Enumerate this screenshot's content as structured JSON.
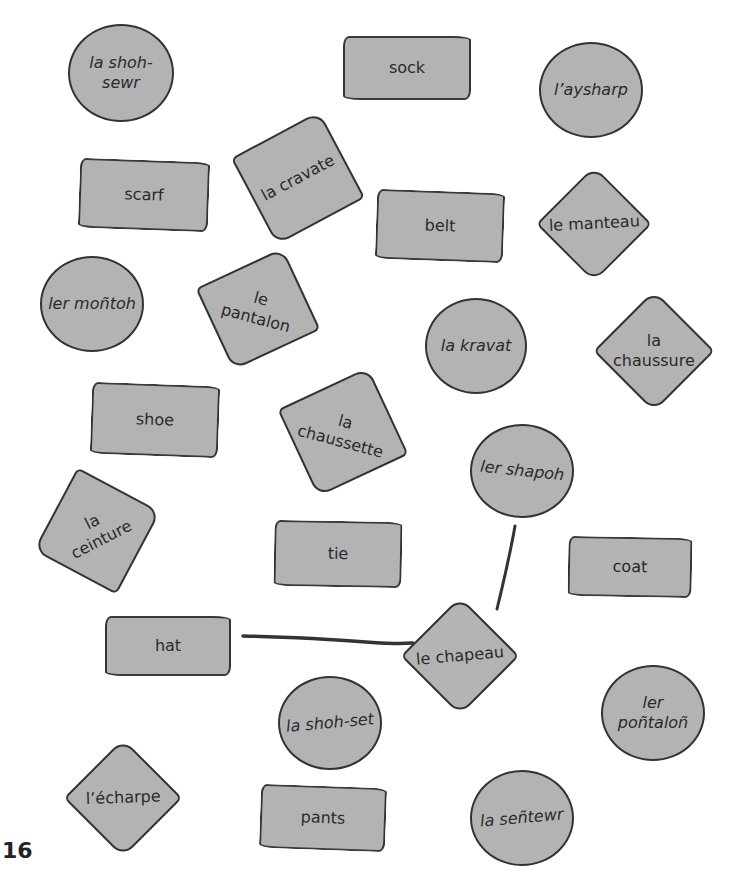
{
  "page_number": "16",
  "colors": {
    "card_fill": "#b3b3b3",
    "card_outline": "#333333",
    "connector_line": "#333333",
    "background": "#ffffff"
  },
  "cards": [
    {
      "id": "la-shoh-sewr",
      "type": "pronunciation",
      "shape": "circle",
      "label": "la shoh-\nsewr"
    },
    {
      "id": "sock",
      "type": "english",
      "shape": "rect",
      "label": "sock"
    },
    {
      "id": "laysharp",
      "type": "pronunciation",
      "shape": "circle",
      "label": "l’aysharp"
    },
    {
      "id": "la-cravate",
      "type": "french",
      "shape": "square",
      "label": "la cravate"
    },
    {
      "id": "scarf",
      "type": "english",
      "shape": "rect",
      "label": "scarf"
    },
    {
      "id": "belt",
      "type": "english",
      "shape": "rect",
      "label": "belt"
    },
    {
      "id": "le-manteau",
      "type": "french",
      "shape": "square",
      "label": "le manteau"
    },
    {
      "id": "ler-montoh",
      "type": "pronunciation",
      "shape": "circle",
      "label": "ler moñtoh"
    },
    {
      "id": "le-pantalon",
      "type": "french",
      "shape": "square",
      "label": "le\npantalon"
    },
    {
      "id": "la-kravat",
      "type": "pronunciation",
      "shape": "circle",
      "label": "la kravat"
    },
    {
      "id": "la-chaussure",
      "type": "french",
      "shape": "square",
      "label": "la\nchaussure"
    },
    {
      "id": "shoe",
      "type": "english",
      "shape": "rect",
      "label": "shoe"
    },
    {
      "id": "la-chaussette",
      "type": "french",
      "shape": "square",
      "label": "la\nchaussette"
    },
    {
      "id": "ler-shapoh",
      "type": "pronunciation",
      "shape": "circle",
      "label": "ler shapoh"
    },
    {
      "id": "la-ceinture",
      "type": "french",
      "shape": "square",
      "label": "la\nceinture"
    },
    {
      "id": "tie",
      "type": "english",
      "shape": "rect",
      "label": "tie"
    },
    {
      "id": "coat",
      "type": "english",
      "shape": "rect",
      "label": "coat"
    },
    {
      "id": "hat",
      "type": "english",
      "shape": "rect",
      "label": "hat"
    },
    {
      "id": "le-chapeau",
      "type": "french",
      "shape": "square",
      "label": "le chapeau"
    },
    {
      "id": "la-shoh-set",
      "type": "pronunciation",
      "shape": "circle",
      "label": "la shoh-set"
    },
    {
      "id": "ler-pontalon",
      "type": "pronunciation",
      "shape": "circle",
      "label": "ler\npoñtaloñ"
    },
    {
      "id": "lecharpe",
      "type": "french",
      "shape": "square",
      "label": "l’écharpe"
    },
    {
      "id": "pants",
      "type": "english",
      "shape": "rect",
      "label": "pants"
    },
    {
      "id": "la-sentewr",
      "type": "pronunciation",
      "shape": "circle",
      "label": "la señtewr"
    }
  ],
  "connections": [
    {
      "from": "hat",
      "to": "le-chapeau"
    },
    {
      "from": "le-chapeau",
      "to": "ler-shapoh"
    }
  ]
}
